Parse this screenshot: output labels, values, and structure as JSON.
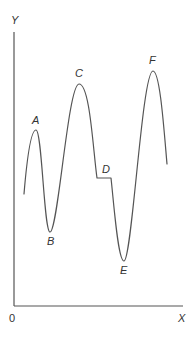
{
  "diagram": {
    "axes": {
      "y_label": "Y",
      "x_label": "X",
      "origin_label": "0"
    },
    "points": {
      "A": "A",
      "B": "B",
      "C": "C",
      "D": "D",
      "E": "E",
      "F": "F"
    },
    "colors": {
      "line": "#555555",
      "text": "#333333",
      "background": "#ffffff"
    }
  }
}
